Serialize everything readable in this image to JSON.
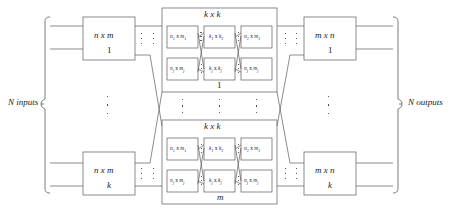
{
  "diagram": {
    "title_hidden": "three-stage Clos network",
    "left_bracket_label": "N inputs",
    "right_bracket_label": "N outputs",
    "input_stage": {
      "dimension": "n x m",
      "first_index": "1",
      "last_index": "k",
      "count_note": "k"
    },
    "output_stage": {
      "dimension": "m x n",
      "first_index": "1",
      "last_index": "k",
      "count_note": "k"
    },
    "middle_stage": {
      "block_title": "k x k",
      "first_index": "1",
      "last_index": "m",
      "count_note": "m",
      "rows": [
        {
          "left": "n1 x m1",
          "left_base": "n",
          "left_sub1": "1",
          "left_base2": "m",
          "left_sub2": "1",
          "center_base": "k",
          "center_sub1": "1",
          "center_base2": "k",
          "center_sub2": "1",
          "right_base": "n",
          "right_sub1": "1",
          "right_base2": "m",
          "right_sub2": "1"
        },
        {
          "left_base": "n",
          "left_sub1": "j",
          "left_base2": "m",
          "left_sub2": "j",
          "center_base": "k",
          "center_sub1": "j",
          "center_base2": "k",
          "center_sub2": "j",
          "right_base": "n",
          "right_sub1": "j",
          "right_base2": "m",
          "right_sub2": "j"
        }
      ],
      "times_symbol": "x"
    }
  },
  "colors": {
    "line": "#555555",
    "text": "#1a1a1a",
    "background": "#ffffff"
  }
}
